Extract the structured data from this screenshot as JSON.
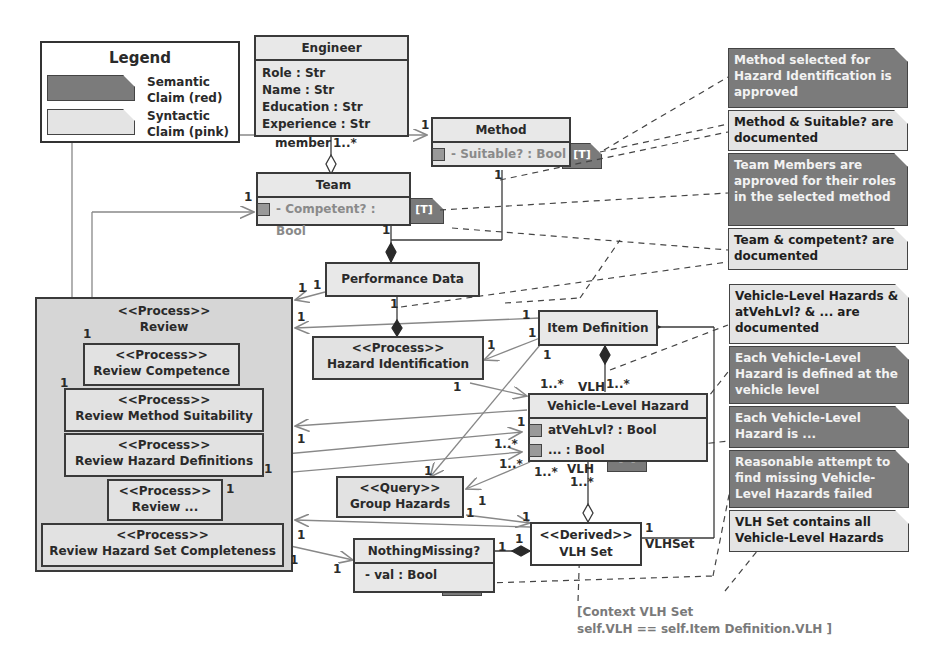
{
  "legend": {
    "title": "Legend",
    "items": [
      {
        "label_line1": "Semantic",
        "label_line2": "Claim (red)",
        "swatch_color": "#7b7b7b"
      },
      {
        "label_line1": "Syntactic",
        "label_line2": "Claim (pink)",
        "swatch_color": "#e4e4e4"
      }
    ]
  },
  "classes": {
    "engineer": {
      "title": "Engineer",
      "attrs": [
        "Role : Str",
        "Name : Str",
        "Education : Str",
        "Experience : Str"
      ],
      "role_label": "member",
      "mult": "1..*"
    },
    "method": {
      "title": "Method",
      "attr": "- Suitable? : Bool",
      "tag": "[T]",
      "mult_left": "1",
      "mult_bottom": "1"
    },
    "team": {
      "title": "Team",
      "attr": "- Competent? : Bool",
      "tag": "[T]",
      "mult_left": "1",
      "mult_bottom": "1"
    },
    "performance_data": {
      "title": "Performance Data"
    },
    "item_definition": {
      "title": "Item Definition"
    },
    "hazard_identification": {
      "stereotype": "<<Process>>",
      "title": "Hazard Identification"
    },
    "vehicle_level_hazard": {
      "title": "Vehicle-Level Hazard",
      "attrs": [
        "atVehLvl? : Bool",
        "... : Bool"
      ],
      "tag": "[T]"
    },
    "group_hazards": {
      "stereotype": "<<Query>>",
      "title": "Group Hazards"
    },
    "vlh_set": {
      "stereotype": "<<Derived>>",
      "title": "VLH Set",
      "role_label": "VLHSet"
    },
    "nothing_missing": {
      "title": "NothingMissing?",
      "attr": "- val : Bool",
      "tag": "[T]"
    }
  },
  "processes": {
    "review": {
      "stereotype": "<<Process>>",
      "title": "Review"
    },
    "review_competence": {
      "stereotype": "<<Process>>",
      "title": "Review Competence"
    },
    "review_method_suitability": {
      "stereotype": "<<Process>>",
      "title": "Review Method Suitability"
    },
    "review_hazard_definitions": {
      "stereotype": "<<Process>>",
      "title": "Review Hazard Definitions"
    },
    "review_etc": {
      "stereotype": "<<Process>>",
      "title": "Review ..."
    },
    "review_hazard_set_completeness": {
      "stereotype": "<<Process>>",
      "title": "Review Hazard Set Completeness"
    }
  },
  "notes": [
    {
      "type": "semantic",
      "text": "Method selected for Hazard Identification  is approved"
    },
    {
      "type": "syntactic",
      "text": "Method & Suitable? are documented"
    },
    {
      "type": "semantic",
      "text": "Team Members are approved for their roles in the selected method"
    },
    {
      "type": "syntactic",
      "text": "Team & competent? are documented"
    },
    {
      "type": "syntactic",
      "text": "Vehicle-Level Hazards & atVehLvl? & ... are documented"
    },
    {
      "type": "semantic",
      "text": "Each Vehicle-Level Hazard is defined at the vehicle level"
    },
    {
      "type": "semantic",
      "text": "Each Vehicle-Level Hazard is ..."
    },
    {
      "type": "semantic",
      "text": "Reasonable attempt to find missing Vehicle-Level Hazards failed"
    },
    {
      "type": "syntactic",
      "text": "VLH Set contains all Vehicle-Level Hazards"
    }
  ],
  "multiplicities": {
    "one": "1",
    "many": "1..*",
    "vlh": "VLH"
  },
  "constraint": {
    "line1": "[Context VLH Set",
    "line2": "self.VLH == self.Item Definition.VLH ]"
  }
}
